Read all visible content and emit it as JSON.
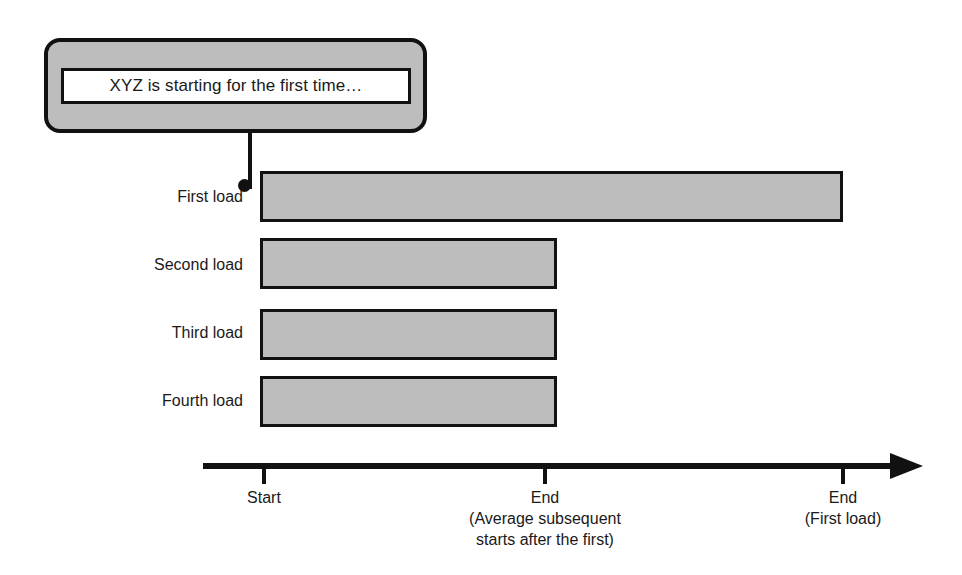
{
  "figure": {
    "callout": {
      "message": "XYZ is starting for the first time…",
      "connector": "pointer-to-first-load-bar"
    },
    "colors": {
      "bar_fill": "#bdbdbd",
      "bar_stroke": "#121212",
      "callout_fill": "#bdbdbd",
      "callout_stroke": "#111111",
      "callout_inner_fill": "#ffffff",
      "axis": "#111111",
      "text": "#1a1a1a",
      "background": "#ffffff"
    }
  },
  "chart_data": {
    "type": "bar",
    "orientation": "horizontal",
    "title": "",
    "xlabel": "",
    "ylabel": "",
    "grid": false,
    "legend": null,
    "categories": [
      "First load",
      "Second load",
      "Third load",
      "Fourth load"
    ],
    "values": [
      100,
      34,
      34,
      34
    ],
    "value_unit": "relative duration (% of first load)",
    "xlim": [
      0,
      100
    ],
    "axis": {
      "start_px": 203,
      "arrow": true,
      "ticks": [
        {
          "value": 0,
          "lines": [
            "Start"
          ]
        },
        {
          "value": 34,
          "lines": [
            "End",
            "(Average subsequent",
            "starts after the first)"
          ]
        },
        {
          "value": 100,
          "lines": [
            "End",
            "(First load)"
          ]
        }
      ]
    },
    "bars": [
      {
        "label": "First load",
        "value": 100,
        "top_px": 171,
        "height_px": 51,
        "left_px": 260,
        "right_px": 843,
        "label_baseline_px": 190
      },
      {
        "label": "Second load",
        "value": 34,
        "top_px": 238,
        "height_px": 51,
        "left_px": 260,
        "right_px": 557,
        "label_baseline_px": 258
      },
      {
        "label": "Third load",
        "value": 34,
        "top_px": 309,
        "height_px": 51,
        "left_px": 260,
        "right_px": 557,
        "label_baseline_px": 326
      },
      {
        "label": "Fourth load",
        "value": 34,
        "top_px": 376,
        "height_px": 51,
        "left_px": 260,
        "right_px": 557,
        "label_baseline_px": 394
      }
    ],
    "annotations": [
      {
        "text": "XYZ is starting for the first time…",
        "attached_to": "First load"
      }
    ]
  }
}
